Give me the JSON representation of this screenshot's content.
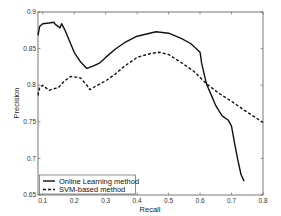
{
  "chart_data": {
    "type": "line",
    "title": "",
    "xlabel": "Recall",
    "ylabel": "Precision",
    "xlim": [
      0.085,
      0.8
    ],
    "ylim": [
      0.65,
      0.9
    ],
    "xticks": [
      0.1,
      0.2,
      0.3,
      0.4,
      0.5,
      0.6,
      0.7,
      0.8
    ],
    "xtick_labels": [
      "0.1",
      "0.2",
      "0.3",
      "0.4",
      "0.5",
      "0.6",
      "0.7",
      "0.8"
    ],
    "yticks": [
      0.65,
      0.7,
      0.75,
      0.8,
      0.85,
      0.9
    ],
    "ytick_labels": [
      "0.65",
      "0.7",
      "0.75",
      "0.8",
      "0.85",
      "0.9"
    ],
    "grid": false,
    "legend_position": "lower left",
    "series": [
      {
        "name": "Online Learning method",
        "style": "solid",
        "color": "#111111",
        "x": [
          0.085,
          0.09,
          0.1,
          0.12,
          0.135,
          0.14,
          0.15,
          0.155,
          0.16,
          0.17,
          0.2,
          0.22,
          0.24,
          0.26,
          0.28,
          0.3,
          0.33,
          0.36,
          0.4,
          0.43,
          0.46,
          0.5,
          0.54,
          0.57,
          0.6,
          0.605,
          0.62,
          0.64,
          0.65,
          0.67,
          0.69,
          0.7,
          0.71,
          0.72,
          0.73,
          0.74
        ],
        "y": [
          0.868,
          0.88,
          0.884,
          0.885,
          0.886,
          0.883,
          0.88,
          0.878,
          0.884,
          0.876,
          0.845,
          0.832,
          0.823,
          0.826,
          0.83,
          0.838,
          0.849,
          0.858,
          0.867,
          0.87,
          0.873,
          0.871,
          0.864,
          0.857,
          0.845,
          0.83,
          0.802,
          0.782,
          0.772,
          0.758,
          0.752,
          0.744,
          0.72,
          0.698,
          0.678,
          0.669
        ]
      },
      {
        "name": "SVM-based method",
        "style": "dashed",
        "color": "#111111",
        "x": [
          0.085,
          0.09,
          0.1,
          0.12,
          0.15,
          0.17,
          0.19,
          0.22,
          0.24,
          0.25,
          0.27,
          0.3,
          0.33,
          0.36,
          0.4,
          0.44,
          0.47,
          0.5,
          0.54,
          0.58,
          0.62,
          0.66,
          0.7,
          0.74,
          0.8
        ],
        "y": [
          0.786,
          0.797,
          0.8,
          0.793,
          0.797,
          0.806,
          0.812,
          0.81,
          0.8,
          0.794,
          0.799,
          0.806,
          0.815,
          0.826,
          0.838,
          0.843,
          0.845,
          0.842,
          0.831,
          0.819,
          0.802,
          0.789,
          0.778,
          0.766,
          0.749
        ]
      }
    ]
  }
}
